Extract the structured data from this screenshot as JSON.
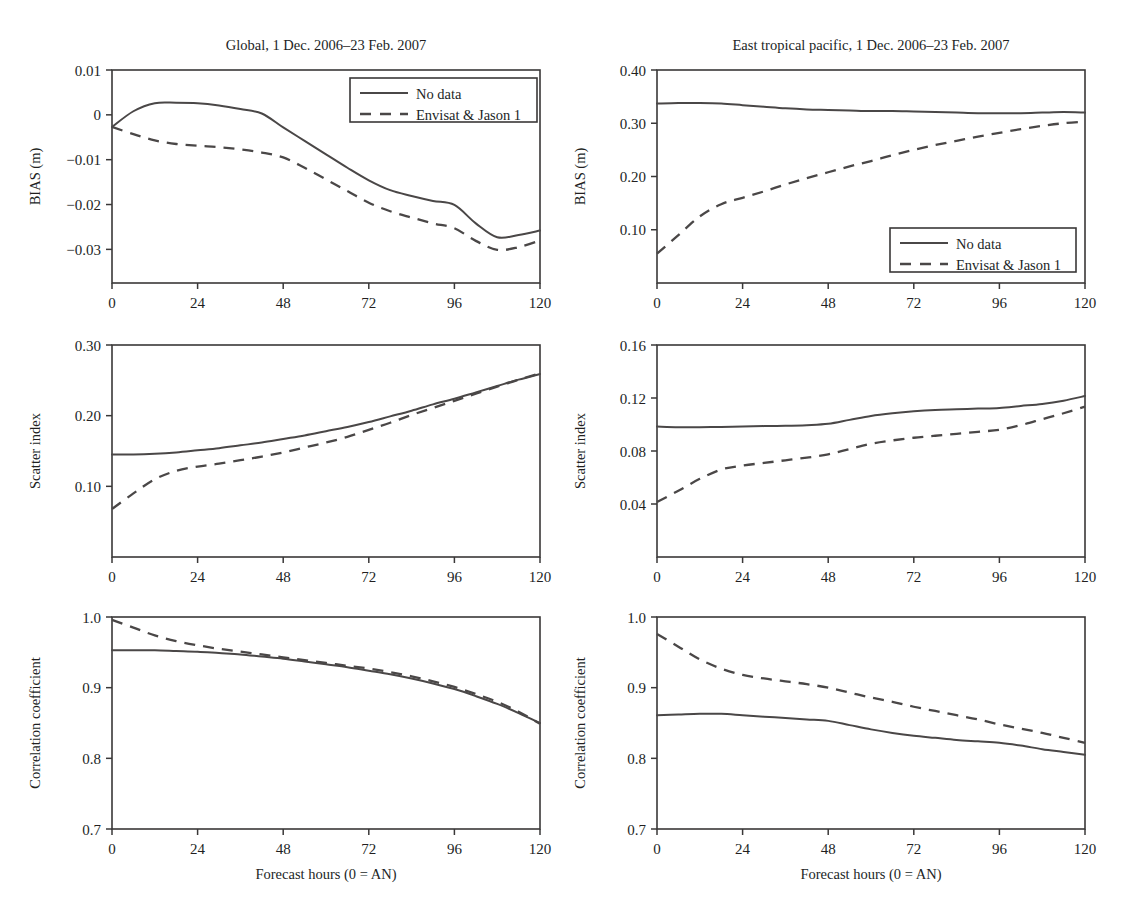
{
  "figure": {
    "width": 1142,
    "height": 919,
    "background": "#ffffff",
    "line_color": "#4a4747",
    "text_color": "#221f1f",
    "xlabel": "Forecast hours (0 = AN)",
    "legend": {
      "entries": [
        {
          "label": "No data",
          "style": "solid"
        },
        {
          "label": "Envisat & Jason 1",
          "style": "dashed"
        }
      ]
    },
    "column_titles": [
      "Global, 1 Dec. 2006–23 Feb. 2007",
      "East tropical pacific, 1 Dec. 2006–23 Feb. 2007"
    ]
  },
  "chart_data": [
    {
      "id": "bias-global",
      "type": "line",
      "title": "Global, 1 Dec. 2006–23 Feb. 2007",
      "xlabel": "",
      "ylabel": "BIAS (m)",
      "xlim": [
        0,
        120
      ],
      "ylim": [
        -0.0375,
        0.01
      ],
      "xticks": [
        0,
        24,
        48,
        72,
        96,
        120
      ],
      "xticklabels": [
        "0",
        "24",
        "48",
        "72",
        "96",
        "120"
      ],
      "yticks": [
        0.01,
        0,
        -0.01,
        -0.02,
        -0.03
      ],
      "yticklabels": [
        "0.01",
        "0",
        "−0.01",
        "−0.02",
        "−0.03"
      ],
      "grid": false,
      "legend_position": "top-right",
      "x": [
        0,
        6,
        12,
        18,
        24,
        30,
        36,
        42,
        48,
        54,
        60,
        66,
        72,
        78,
        84,
        90,
        96,
        102,
        108,
        114,
        120
      ],
      "series": [
        {
          "name": "No data",
          "style": "solid",
          "values": [
            -0.0027,
            0.0008,
            0.0026,
            0.0027,
            0.0026,
            0.0021,
            0.0013,
            0.0003,
            -0.0028,
            -0.0058,
            -0.0088,
            -0.0118,
            -0.0146,
            -0.0168,
            -0.0181,
            -0.0192,
            -0.0201,
            -0.0242,
            -0.0273,
            -0.0268,
            -0.0258
          ]
        },
        {
          "name": "Envisat & Jason 1",
          "style": "dashed",
          "values": [
            -0.0027,
            -0.0043,
            -0.0057,
            -0.0065,
            -0.0069,
            -0.0072,
            -0.0077,
            -0.0084,
            -0.0095,
            -0.0118,
            -0.0144,
            -0.017,
            -0.0196,
            -0.0215,
            -0.0229,
            -0.0242,
            -0.0253,
            -0.0281,
            -0.0301,
            -0.0295,
            -0.028
          ]
        }
      ]
    },
    {
      "id": "bias-east-tropical-pacific",
      "type": "line",
      "title": "East tropical pacific, 1 Dec. 2006–23 Feb. 2007",
      "xlabel": "",
      "ylabel": "BIAS (m)",
      "xlim": [
        0,
        120
      ],
      "ylim": [
        0.0,
        0.4
      ],
      "xticks": [
        0,
        24,
        48,
        72,
        96,
        120
      ],
      "xticklabels": [
        "0",
        "24",
        "48",
        "72",
        "96",
        "120"
      ],
      "yticks": [
        0.4,
        0.3,
        0.2,
        0.1
      ],
      "yticklabels": [
        "0.40",
        "0.30",
        "0.20",
        "0.10"
      ],
      "grid": false,
      "legend_position": "bottom-right",
      "x": [
        0,
        6,
        12,
        18,
        24,
        30,
        36,
        42,
        48,
        54,
        60,
        66,
        72,
        78,
        84,
        90,
        96,
        102,
        108,
        114,
        120
      ],
      "series": [
        {
          "name": "No data",
          "style": "solid",
          "values": [
            0.337,
            0.338,
            0.338,
            0.337,
            0.334,
            0.331,
            0.328,
            0.326,
            0.325,
            0.324,
            0.323,
            0.323,
            0.322,
            0.321,
            0.32,
            0.319,
            0.319,
            0.319,
            0.32,
            0.321,
            0.32
          ]
        },
        {
          "name": "Envisat & Jason 1",
          "style": "dashed",
          "values": [
            0.055,
            0.09,
            0.125,
            0.148,
            0.16,
            0.172,
            0.185,
            0.197,
            0.208,
            0.219,
            0.229,
            0.24,
            0.25,
            0.259,
            0.267,
            0.275,
            0.282,
            0.289,
            0.295,
            0.3,
            0.303
          ]
        }
      ]
    },
    {
      "id": "scatter-index-global",
      "type": "line",
      "title": "",
      "xlabel": "",
      "ylabel": "Scatter index",
      "xlim": [
        0,
        120
      ],
      "ylim": [
        0.0,
        0.3
      ],
      "xticks": [
        0,
        24,
        48,
        72,
        96,
        120
      ],
      "xticklabels": [
        "0",
        "24",
        "48",
        "72",
        "96",
        "120"
      ],
      "yticks": [
        0.3,
        0.2,
        0.1
      ],
      "yticklabels": [
        "0.30",
        "0.20",
        "0.10"
      ],
      "grid": false,
      "legend_position": "none",
      "x": [
        0,
        6,
        12,
        18,
        24,
        30,
        36,
        42,
        48,
        54,
        60,
        66,
        72,
        78,
        84,
        90,
        96,
        102,
        108,
        114,
        120
      ],
      "series": [
        {
          "name": "No data",
          "style": "solid",
          "values": [
            0.145,
            0.145,
            0.146,
            0.148,
            0.151,
            0.154,
            0.158,
            0.162,
            0.167,
            0.172,
            0.178,
            0.184,
            0.191,
            0.199,
            0.207,
            0.216,
            0.224,
            0.233,
            0.242,
            0.251,
            0.259
          ]
        },
        {
          "name": "Envisat & Jason 1",
          "style": "dashed",
          "values": [
            0.068,
            0.09,
            0.11,
            0.122,
            0.128,
            0.132,
            0.137,
            0.142,
            0.148,
            0.155,
            0.162,
            0.17,
            0.18,
            0.19,
            0.201,
            0.211,
            0.221,
            0.231,
            0.241,
            0.251,
            0.26
          ]
        }
      ]
    },
    {
      "id": "scatter-index-east-tropical-pacific",
      "type": "line",
      "title": "",
      "xlabel": "",
      "ylabel": "Scatter index",
      "xlim": [
        0,
        120
      ],
      "ylim": [
        0.0,
        0.16
      ],
      "xticks": [
        0,
        24,
        48,
        72,
        96,
        120
      ],
      "xticklabels": [
        "0",
        "24",
        "48",
        "72",
        "96",
        "120"
      ],
      "yticks": [
        0.16,
        0.12,
        0.08,
        0.04
      ],
      "yticklabels": [
        "0.16",
        "0.12",
        "0.08",
        "0.04"
      ],
      "grid": false,
      "legend_position": "none",
      "x": [
        0,
        6,
        12,
        18,
        24,
        30,
        36,
        42,
        48,
        54,
        60,
        66,
        72,
        78,
        84,
        90,
        96,
        102,
        108,
        114,
        120
      ],
      "series": [
        {
          "name": "No data",
          "style": "solid",
          "values": [
            0.0985,
            0.098,
            0.098,
            0.0982,
            0.0985,
            0.0988,
            0.099,
            0.0995,
            0.1005,
            0.1035,
            0.1065,
            0.1085,
            0.11,
            0.111,
            0.1115,
            0.112,
            0.1125,
            0.114,
            0.1155,
            0.118,
            0.1215
          ]
        },
        {
          "name": "Envisat & Jason 1",
          "style": "dashed",
          "values": [
            0.0415,
            0.05,
            0.059,
            0.066,
            0.069,
            0.071,
            0.073,
            0.075,
            0.0775,
            0.0815,
            0.0855,
            0.088,
            0.09,
            0.0915,
            0.093,
            0.0945,
            0.096,
            0.0995,
            0.104,
            0.1085,
            0.1135
          ]
        }
      ]
    },
    {
      "id": "correlation-global",
      "type": "line",
      "title": "",
      "xlabel": "Forecast hours (0 = AN)",
      "ylabel": "Correlation coefficient",
      "xlim": [
        0,
        120
      ],
      "ylim": [
        0.7,
        1.0
      ],
      "xticks": [
        0,
        24,
        48,
        72,
        96,
        120
      ],
      "xticklabels": [
        "0",
        "24",
        "48",
        "72",
        "96",
        "120"
      ],
      "yticks": [
        1.0,
        0.9,
        0.8,
        0.7
      ],
      "yticklabels": [
        "1.0",
        "0.9",
        "0.8",
        "0.7"
      ],
      "grid": false,
      "legend_position": "none",
      "x": [
        0,
        6,
        12,
        18,
        24,
        30,
        36,
        42,
        48,
        54,
        60,
        66,
        72,
        78,
        84,
        90,
        96,
        102,
        108,
        114,
        120
      ],
      "series": [
        {
          "name": "No data",
          "style": "solid",
          "values": [
            0.953,
            0.953,
            0.953,
            0.952,
            0.951,
            0.949,
            0.947,
            0.944,
            0.941,
            0.937,
            0.933,
            0.929,
            0.924,
            0.919,
            0.913,
            0.906,
            0.898,
            0.888,
            0.877,
            0.864,
            0.85
          ]
        },
        {
          "name": "Envisat & Jason 1",
          "style": "dashed",
          "values": [
            0.996,
            0.985,
            0.974,
            0.966,
            0.96,
            0.955,
            0.951,
            0.947,
            0.943,
            0.939,
            0.935,
            0.931,
            0.927,
            0.922,
            0.916,
            0.909,
            0.901,
            0.891,
            0.88,
            0.866,
            0.849
          ]
        }
      ]
    },
    {
      "id": "correlation-east-tropical-pacific",
      "type": "line",
      "title": "",
      "xlabel": "Forecast hours (0 = AN)",
      "ylabel": "Correlation coefficient",
      "xlim": [
        0,
        120
      ],
      "ylim": [
        0.7,
        1.0
      ],
      "xticks": [
        0,
        24,
        48,
        72,
        96,
        120
      ],
      "xticklabels": [
        "0",
        "24",
        "48",
        "72",
        "96",
        "120"
      ],
      "yticks": [
        1.0,
        0.9,
        0.8,
        0.7
      ],
      "yticklabels": [
        "1.0",
        "0.9",
        "0.8",
        "0.7"
      ],
      "grid": false,
      "legend_position": "none",
      "x": [
        0,
        6,
        12,
        18,
        24,
        30,
        36,
        42,
        48,
        54,
        60,
        66,
        72,
        78,
        84,
        90,
        96,
        102,
        108,
        114,
        120
      ],
      "series": [
        {
          "name": "No data",
          "style": "solid",
          "values": [
            0.861,
            0.862,
            0.863,
            0.863,
            0.861,
            0.859,
            0.857,
            0.855,
            0.853,
            0.847,
            0.841,
            0.836,
            0.832,
            0.829,
            0.826,
            0.824,
            0.822,
            0.818,
            0.813,
            0.809,
            0.805
          ]
        },
        {
          "name": "Envisat & Jason 1",
          "style": "dashed",
          "values": [
            0.976,
            0.958,
            0.94,
            0.927,
            0.918,
            0.913,
            0.909,
            0.905,
            0.9,
            0.893,
            0.886,
            0.88,
            0.873,
            0.867,
            0.861,
            0.855,
            0.848,
            0.842,
            0.836,
            0.829,
            0.822
          ]
        }
      ]
    }
  ],
  "panel_geometry": [
    {
      "id": "bias-global",
      "x": 112,
      "y": 70,
      "w": 428,
      "h": 213
    },
    {
      "id": "bias-east-tropical-pacific",
      "x": 657,
      "y": 70,
      "w": 428,
      "h": 213
    },
    {
      "id": "scatter-index-global",
      "x": 112,
      "y": 345,
      "w": 428,
      "h": 212
    },
    {
      "id": "scatter-index-east-tropical-pacific",
      "x": 657,
      "y": 345,
      "w": 428,
      "h": 212
    },
    {
      "id": "correlation-global",
      "x": 112,
      "y": 617,
      "w": 428,
      "h": 212
    },
    {
      "id": "correlation-east-tropical-pacific",
      "x": 657,
      "y": 617,
      "w": 428,
      "h": 212
    }
  ],
  "legend_geometry": [
    {
      "panel": "bias-global",
      "x": 350,
      "y": 78,
      "w": 187,
      "h": 44
    },
    {
      "panel": "bias-east-tropical-pacific",
      "x": 890,
      "y": 228,
      "w": 186,
      "h": 44
    }
  ]
}
